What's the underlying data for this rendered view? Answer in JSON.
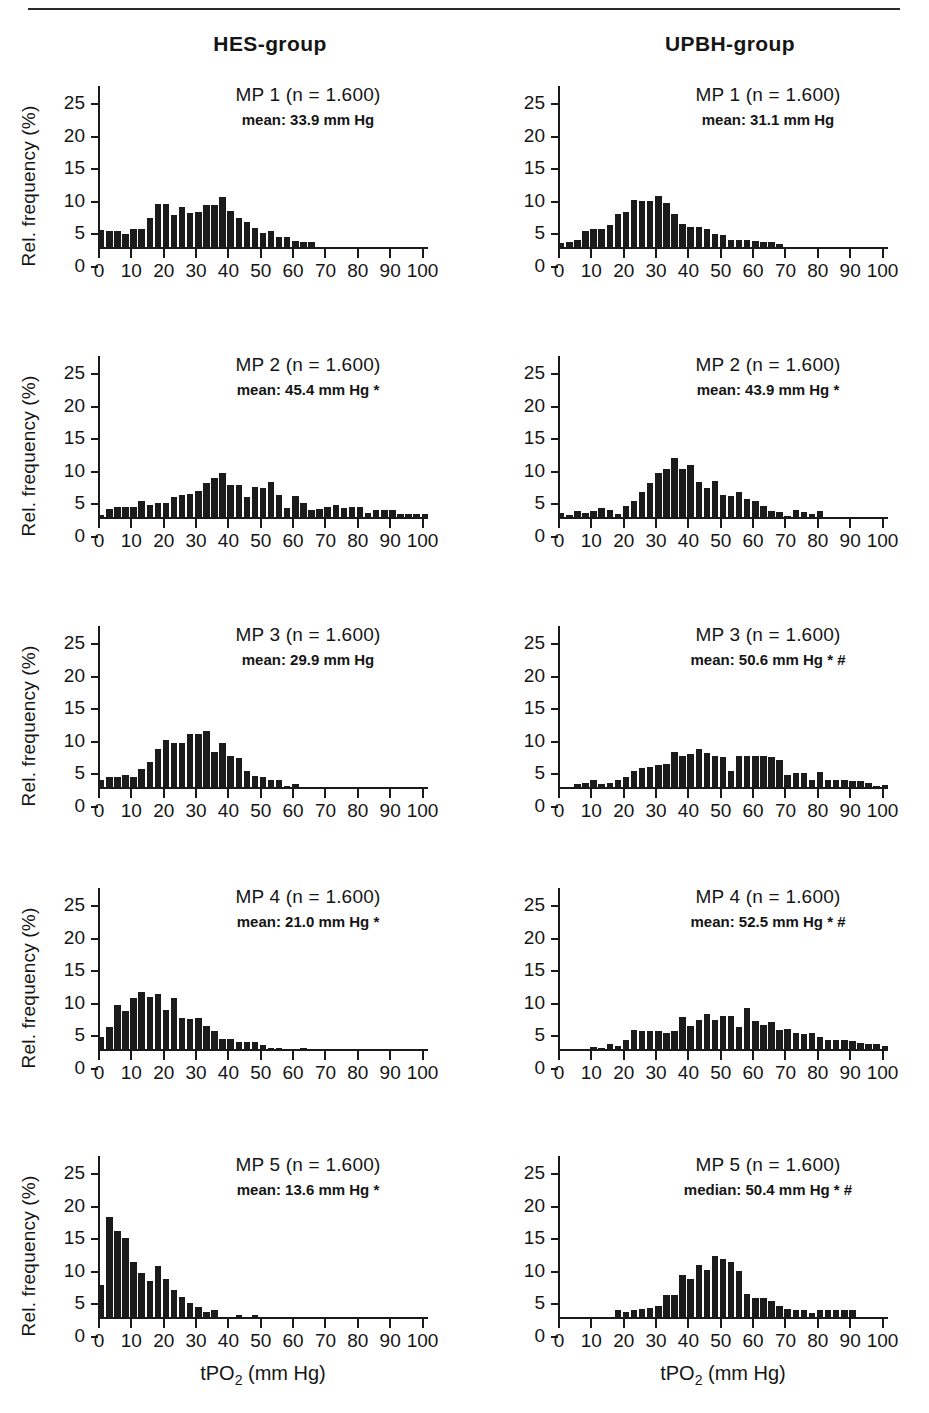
{
  "figure": {
    "column_titles": [
      "HES-group",
      "UPBH-group"
    ],
    "y_axis_label": "Rel. frequency (%)",
    "x_axis_label_main": "tPO",
    "x_axis_label_sub": "2",
    "x_axis_label_unit": " (mm Hg)",
    "y_ticks": [
      0,
      5,
      10,
      15,
      20,
      25
    ],
    "x_ticks": [
      0,
      10,
      20,
      30,
      40,
      50,
      60,
      70,
      80,
      90,
      100
    ],
    "bar_color": "#1b1b1b",
    "axis_color": "#1a1a1a"
  },
  "chart_data": [
    {
      "type": "bar",
      "panel_id": "hes-mp1",
      "group": "HES-group",
      "title": "MP 1 (n = 1.600)",
      "subtitle": "mean: 33.9 mm Hg",
      "stat_label": "mean",
      "stat_value": 33.9,
      "stat_unit": "mm Hg",
      "significance": "",
      "n": 1600,
      "xlabel": "tPO2 (mm Hg)",
      "ylabel": "Rel. frequency (%)",
      "xlim": [
        0,
        102
      ],
      "ylim": [
        0,
        25
      ],
      "bin_width": 2.5,
      "bin_starts": [
        0,
        2.5,
        5,
        7.5,
        10,
        12.5,
        15,
        17.5,
        20,
        22.5,
        25,
        27.5,
        30,
        32.5,
        35,
        37.5,
        40,
        42.5,
        45,
        47.5,
        50,
        52.5,
        55,
        57.5,
        60,
        62.5,
        65
      ],
      "values": [
        2.6,
        2.5,
        2.5,
        2.0,
        2.8,
        2.8,
        4.4,
        6.6,
        6.6,
        4.9,
        6.2,
        5.2,
        5.3,
        6.5,
        6.5,
        7.6,
        5.5,
        4.5,
        3.9,
        2.9,
        2.2,
        2.5,
        1.6,
        1.5,
        0.9,
        0.8,
        0.8
      ]
    },
    {
      "type": "bar",
      "panel_id": "upbh-mp1",
      "group": "UPBH-group",
      "title": "MP 1 (n = 1.600)",
      "subtitle": "mean: 31.1 mm Hg",
      "stat_label": "mean",
      "stat_value": 31.1,
      "stat_unit": "mm Hg",
      "significance": "",
      "n": 1600,
      "xlabel": "tPO2 (mm Hg)",
      "ylabel": "Rel. frequency (%)",
      "xlim": [
        0,
        102
      ],
      "ylim": [
        0,
        25
      ],
      "bin_width": 2.5,
      "bin_starts": [
        0,
        2.5,
        5,
        7.5,
        10,
        12.5,
        15,
        17.5,
        20,
        22.5,
        25,
        27.5,
        30,
        32.5,
        35,
        37.5,
        40,
        42.5,
        45,
        47.5,
        50,
        52.5,
        55,
        57.5,
        60,
        62.5,
        65,
        67.5
      ],
      "values": [
        0.6,
        0.7,
        1.0,
        2.4,
        2.7,
        2.8,
        3.4,
        5.1,
        5.3,
        7.2,
        7.1,
        7.0,
        7.9,
        6.8,
        5.0,
        3.5,
        3.1,
        3.0,
        2.7,
        2.0,
        1.9,
        1.1,
        1.0,
        1.0,
        0.9,
        0.8,
        0.8,
        0.4
      ]
    },
    {
      "type": "bar",
      "panel_id": "hes-mp2",
      "group": "HES-group",
      "title": "MP 2 (n = 1.600)",
      "subtitle": "mean: 45.4 mm Hg  *",
      "stat_label": "mean",
      "stat_value": 45.4,
      "stat_unit": "mm Hg",
      "significance": "*",
      "n": 1600,
      "xlabel": "tPO2 (mm Hg)",
      "ylabel": "Rel. frequency (%)",
      "xlim": [
        0,
        102
      ],
      "ylim": [
        0,
        25
      ],
      "bin_width": 2.5,
      "bin_starts": [
        0,
        2.5,
        5,
        7.5,
        10,
        12.5,
        15,
        17.5,
        20,
        22.5,
        25,
        27.5,
        30,
        32.5,
        35,
        37.5,
        40,
        42.5,
        45,
        47.5,
        50,
        52.5,
        55,
        57.5,
        60,
        62.5,
        65,
        67.5,
        70,
        72.5,
        75,
        77.5,
        80,
        82.5,
        85,
        87.5,
        90,
        92.5,
        95,
        97.5,
        100
      ],
      "values": [
        0.3,
        1.3,
        1.6,
        1.5,
        1.6,
        2.5,
        1.9,
        2.1,
        2.1,
        3.0,
        3.4,
        3.6,
        4.0,
        5.2,
        6.0,
        6.8,
        4.9,
        4.9,
        3.1,
        4.6,
        4.4,
        5.4,
        3.4,
        1.4,
        3.2,
        2.1,
        1.1,
        1.3,
        1.5,
        1.8,
        1.4,
        1.5,
        1.5,
        0.6,
        1.0,
        1.0,
        1.0,
        0.4,
        0.4,
        0.4,
        0.4
      ]
    },
    {
      "type": "bar",
      "panel_id": "upbh-mp2",
      "group": "UPBH-group",
      "title": "MP 2 (n = 1.600)",
      "subtitle": "mean: 43.9 mm Hg  *",
      "stat_label": "mean",
      "stat_value": 43.9,
      "stat_unit": "mm Hg",
      "significance": "*",
      "n": 1600,
      "xlabel": "tPO2 (mm Hg)",
      "ylabel": "Rel. frequency (%)",
      "xlim": [
        0,
        102
      ],
      "ylim": [
        0,
        25
      ],
      "bin_width": 2.5,
      "bin_starts": [
        0,
        2.5,
        5,
        7.5,
        10,
        12.5,
        15,
        17.5,
        20,
        22.5,
        25,
        27.5,
        30,
        32.5,
        35,
        37.5,
        40,
        42.5,
        45,
        47.5,
        50,
        52.5,
        55,
        57.5,
        60,
        62.5,
        65,
        67.5,
        70,
        72.5,
        75,
        77.5,
        80
      ],
      "values": [
        0.6,
        0.3,
        0.9,
        0.6,
        0.9,
        1.4,
        1.1,
        0.5,
        1.7,
        2.4,
        3.9,
        5.2,
        6.8,
        7.4,
        9.0,
        7.3,
        8.0,
        5.4,
        4.4,
        5.6,
        3.3,
        3.2,
        3.8,
        2.8,
        2.5,
        1.7,
        0.9,
        0.8,
        0.2,
        1.0,
        0.7,
        0.5,
        0.9
      ]
    },
    {
      "type": "bar",
      "panel_id": "hes-mp3",
      "group": "HES-group",
      "title": "MP 3 (n = 1.600)",
      "subtitle": "mean: 29.9 mm Hg",
      "stat_label": "mean",
      "stat_value": 29.9,
      "stat_unit": "mm Hg",
      "significance": "",
      "n": 1600,
      "xlabel": "tPO2 (mm Hg)",
      "ylabel": "Rel. frequency (%)",
      "xlim": [
        0,
        102
      ],
      "ylim": [
        0,
        25
      ],
      "bin_width": 2.5,
      "bin_starts": [
        0,
        2.5,
        5,
        7.5,
        10,
        12.5,
        15,
        17.5,
        20,
        22.5,
        25,
        27.5,
        30,
        32.5,
        35,
        37.5,
        40,
        42.5,
        45,
        47.5,
        50,
        52.5,
        55,
        57.5,
        60
      ],
      "values": [
        1.0,
        1.5,
        1.5,
        1.9,
        1.6,
        2.8,
        3.8,
        5.9,
        7.2,
        6.7,
        6.7,
        8.2,
        8.2,
        8.6,
        5.4,
        6.8,
        4.8,
        4.4,
        2.4,
        1.7,
        1.6,
        1.1,
        1.1,
        0.2,
        0.4
      ]
    },
    {
      "type": "bar",
      "panel_id": "upbh-mp3",
      "group": "UPBH-group",
      "title": "MP 3 (n = 1.600)",
      "subtitle": "mean: 50.6 mm Hg  * #",
      "stat_label": "mean",
      "stat_value": 50.6,
      "stat_unit": "mm Hg",
      "significance": "* #",
      "n": 1600,
      "xlabel": "tPO2 (mm Hg)",
      "ylabel": "Rel. frequency (%)",
      "xlim": [
        0,
        102
      ],
      "ylim": [
        0,
        25
      ],
      "bin_width": 2.5,
      "bin_starts": [
        5,
        7.5,
        10,
        12.5,
        15,
        17.5,
        20,
        22.5,
        25,
        27.5,
        30,
        32.5,
        35,
        37.5,
        40,
        42.5,
        45,
        47.5,
        50,
        52.5,
        55,
        57.5,
        60,
        62.5,
        65,
        67.5,
        70,
        72.5,
        75,
        77.5,
        80,
        82.5,
        85,
        87.5,
        90,
        92.5,
        95,
        97.5,
        100
      ],
      "values": [
        0.5,
        0.6,
        1.0,
        0.5,
        0.6,
        1.1,
        1.6,
        2.4,
        2.9,
        3.1,
        3.4,
        3.5,
        5.4,
        4.7,
        5.0,
        5.9,
        5.2,
        4.8,
        4.6,
        2.5,
        4.7,
        4.7,
        4.7,
        4.7,
        4.6,
        4.2,
        1.9,
        2.2,
        2.2,
        1.0,
        2.3,
        1.1,
        1.0,
        1.0,
        0.9,
        0.9,
        0.6,
        0.2,
        0.3
      ]
    },
    {
      "type": "bar",
      "panel_id": "hes-mp4",
      "group": "HES-group",
      "title": "MP 4 (n = 1.600)",
      "subtitle": "mean: 21.0 mm Hg  *",
      "stat_label": "mean",
      "stat_value": 21.0,
      "stat_unit": "mm Hg",
      "significance": "*",
      "n": 1600,
      "xlabel": "tPO2 (mm Hg)",
      "ylabel": "Rel. frequency (%)",
      "xlim": [
        0,
        102
      ],
      "ylim": [
        0,
        25
      ],
      "bin_width": 2.5,
      "bin_starts": [
        0,
        2.5,
        5,
        7.5,
        10,
        12.5,
        15,
        17.5,
        20,
        22.5,
        25,
        27.5,
        30,
        32.5,
        35,
        37.5,
        40,
        42.5,
        45,
        47.5,
        50,
        52.5,
        55,
        62.5
      ],
      "values": [
        1.8,
        3.3,
        6.8,
        5.9,
        7.9,
        8.8,
        8.0,
        8.5,
        6.0,
        7.8,
        4.8,
        4.6,
        4.7,
        3.5,
        2.8,
        1.5,
        1.6,
        1.1,
        1.0,
        1.0,
        0.6,
        0.2,
        0.2,
        0.2
      ]
    },
    {
      "type": "bar",
      "panel_id": "upbh-mp4",
      "group": "UPBH-group",
      "title": "MP 4 (n = 1.600)",
      "subtitle": "mean: 52.5 mm Hg  * #",
      "stat_label": "mean",
      "stat_value": 52.5,
      "stat_unit": "mm Hg",
      "significance": "* #",
      "n": 1600,
      "xlabel": "tPO2 (mm Hg)",
      "ylabel": "Rel. frequency (%)",
      "xlim": [
        0,
        102
      ],
      "ylim": [
        0,
        25
      ],
      "bin_width": 2.5,
      "bin_starts": [
        10,
        12.5,
        15,
        17.5,
        20,
        22.5,
        25,
        27.5,
        30,
        32.5,
        35,
        37.5,
        40,
        42.5,
        45,
        47.5,
        50,
        52.5,
        55,
        57.5,
        60,
        62.5,
        65,
        67.5,
        70,
        72.5,
        75,
        77.5,
        80,
        82.5,
        85,
        87.5,
        90,
        92.5,
        95,
        97.5,
        100
      ],
      "values": [
        0.3,
        0.2,
        0.7,
        0.5,
        1.4,
        2.9,
        2.8,
        2.7,
        2.8,
        2.4,
        2.7,
        4.9,
        3.6,
        4.5,
        5.3,
        4.5,
        5.0,
        5.0,
        3.3,
        6.3,
        4.3,
        3.7,
        4.1,
        2.9,
        3.1,
        2.4,
        2.3,
        2.4,
        1.8,
        1.4,
        1.4,
        1.4,
        1.3,
        0.9,
        0.8,
        0.7,
        0.5
      ]
    },
    {
      "type": "bar",
      "panel_id": "hes-mp5",
      "group": "HES-group",
      "title": "MP 5 (n = 1.600)",
      "subtitle": "mean: 13.6 mm Hg *",
      "stat_label": "mean",
      "stat_value": 13.6,
      "stat_unit": "mm Hg",
      "significance": "*",
      "n": 1600,
      "xlabel": "tPO2 (mm Hg)",
      "ylabel": "Rel. frequency (%)",
      "xlim": [
        0,
        102
      ],
      "ylim": [
        0,
        25
      ],
      "bin_width": 2.5,
      "bin_starts": [
        0,
        2.5,
        5,
        7.5,
        10,
        12.5,
        15,
        17.5,
        20,
        22.5,
        25,
        27.5,
        30,
        32.5,
        35,
        42.5,
        47.5
      ],
      "values": [
        4.9,
        15.4,
        13.2,
        12.1,
        8.4,
        6.7,
        5.6,
        7.8,
        5.8,
        4.2,
        3.0,
        2.2,
        1.5,
        0.7,
        1.0,
        0.3,
        0.3
      ]
    },
    {
      "type": "bar",
      "panel_id": "upbh-mp5",
      "group": "UPBH-group",
      "title": "MP 5 (n = 1.600)",
      "subtitle": "median: 50.4 mm Hg  * #",
      "stat_label": "median",
      "stat_value": 50.4,
      "stat_unit": "mm Hg",
      "significance": "* #",
      "n": 1600,
      "xlabel": "tPO2 (mm Hg)",
      "ylabel": "Rel. frequency (%)",
      "xlim": [
        0,
        102
      ],
      "ylim": [
        0,
        25
      ],
      "bin_width": 2.5,
      "bin_starts": [
        17.5,
        20,
        22.5,
        25,
        27.5,
        30,
        32.5,
        35,
        37.5,
        40,
        42.5,
        45,
        47.5,
        50,
        52.5,
        55,
        57.5,
        60,
        62.5,
        65,
        67.5,
        70,
        72.5,
        75,
        77.5,
        80,
        82.5,
        85,
        87.5,
        90
      ],
      "values": [
        1.1,
        0.8,
        1.0,
        1.2,
        1.4,
        1.7,
        3.3,
        3.3,
        6.5,
        5.8,
        8.0,
        7.2,
        9.4,
        8.9,
        8.5,
        7.0,
        3.5,
        2.9,
        2.9,
        2.4,
        1.7,
        1.2,
        1.1,
        1.1,
        0.6,
        1.0,
        1.0,
        1.0,
        1.0,
        1.0
      ]
    }
  ]
}
